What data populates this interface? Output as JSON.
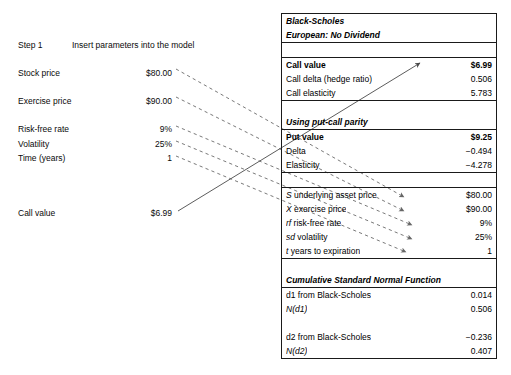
{
  "worksheet": {
    "step_label": "Step 1",
    "step_text": "Insert parameters into the model",
    "inputs": [
      {
        "label": "Stock price",
        "value": "$80.00"
      },
      {
        "label": "Exercise price",
        "value": "$90.00"
      },
      {
        "label": "Risk-free rate",
        "value": "9%"
      },
      {
        "label": "Volatility",
        "value": "25%"
      },
      {
        "label": "Time (years)",
        "value": "1"
      }
    ],
    "output": {
      "label": "Call value",
      "value": "$6.99"
    }
  },
  "model": {
    "title_line1": "Black-Scholes",
    "title_line2": "European:  No Dividend",
    "call_section": [
      {
        "name": "Call value",
        "value": "$6.99"
      },
      {
        "name": "Call delta (hedge ratio)",
        "value": "0.506"
      },
      {
        "name": "Call elasticity",
        "value": "5.783"
      }
    ],
    "parity_header": "Using put-call parity",
    "put_section": [
      {
        "name": "Put value",
        "value": "$9.25"
      },
      {
        "name": "Delta",
        "value": "−0.494"
      },
      {
        "name": "Elasticity",
        "value": "−4.278"
      }
    ],
    "parameters": [
      {
        "symbol": "S",
        "name": "underlying asset price",
        "value": "$80.00"
      },
      {
        "symbol": "X",
        "name": "exercise price",
        "value": "$90.00"
      },
      {
        "symbol": "rf",
        "name": "risk-free rate",
        "value": "9%"
      },
      {
        "symbol": "sd",
        "name": "volatility",
        "value": "25%"
      },
      {
        "symbol": "t",
        "name": "years to expiration",
        "value": "1"
      }
    ],
    "cdf_header": "Cumulative Standard Normal Function",
    "cdf_rows": [
      {
        "name": "d1 from Black-Scholes",
        "value": "0.014"
      },
      {
        "name": "N(d1)",
        "value": "0.506",
        "italic_first": true
      },
      {
        "name": "",
        "value": ""
      },
      {
        "name": "d2 from Black-Scholes",
        "value": "−0.236"
      },
      {
        "name": "N(d2)",
        "value": "0.407",
        "italic_first": true
      }
    ]
  },
  "colors": {
    "ink": "#0a0a0a",
    "rule": "#1a1a1a",
    "arrow": "#555555"
  }
}
